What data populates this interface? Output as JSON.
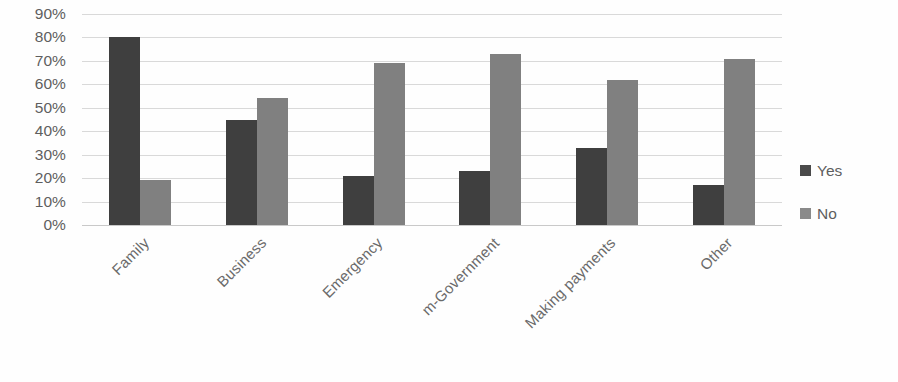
{
  "chart_data": {
    "type": "bar",
    "title": "",
    "subtitle": "",
    "xlabel": "",
    "ylabel": "",
    "categories": [
      "Family",
      "Business",
      "Emergency",
      "m-Government",
      "Making payments",
      "Other"
    ],
    "series": [
      {
        "name": "Yes",
        "color": "#3f3f3f",
        "values": [
          80,
          45,
          21,
          23,
          33,
          17
        ]
      },
      {
        "name": "No",
        "color": "#808080",
        "values": [
          19,
          54,
          69,
          73,
          62,
          71
        ]
      }
    ],
    "ylim": [
      0,
      90
    ],
    "ytick_values": [
      90,
      80,
      70,
      60,
      50,
      40,
      30,
      20,
      10,
      0
    ],
    "ytick_labels": [
      "90%",
      "80%",
      "70%",
      "60%",
      "50%",
      "40%",
      "30%",
      "20%",
      "10%",
      "0%"
    ],
    "grid": "horizontal",
    "legend_position": "right",
    "xtick_rotation": -45,
    "value_unit": "%"
  },
  "legend": {
    "items": [
      {
        "label": "Yes",
        "color": "#3f3f3f"
      },
      {
        "label": "No",
        "color": "#808080"
      }
    ]
  },
  "colors": {
    "series_yes": "#3f3f3f",
    "series_no": "#808080",
    "gridline": "#d9d9d9",
    "text": "#5e5e5e",
    "background": "#fefefe"
  }
}
